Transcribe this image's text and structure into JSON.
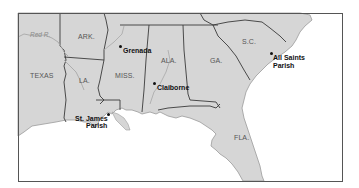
{
  "map": {
    "colors": {
      "land": "#d6d6d6",
      "water": "#ffffff",
      "border": "#3a3a3a",
      "coast": "#9a9a9a",
      "river": "#a8a8a8",
      "frame": "#555555"
    },
    "river": {
      "label": "Red R."
    },
    "states": [
      {
        "id": "texas",
        "label": "TEXAS"
      },
      {
        "id": "arkansas",
        "label": "ARK."
      },
      {
        "id": "louisiana",
        "label": "LA."
      },
      {
        "id": "mississippi",
        "label": "MISS."
      },
      {
        "id": "alabama",
        "label": "ALA."
      },
      {
        "id": "georgia",
        "label": "GA."
      },
      {
        "id": "south-carolina",
        "label": "S.C."
      },
      {
        "id": "florida",
        "label": "FLA."
      }
    ],
    "places": [
      {
        "id": "grenada",
        "line1": "Grenada",
        "line2": ""
      },
      {
        "id": "claiborne",
        "line1": "Claiborne",
        "line2": ""
      },
      {
        "id": "st-james-parish",
        "line1": "St. James",
        "line2": "Parish"
      },
      {
        "id": "all-saints-parish",
        "line1": "All Saints",
        "line2": "Parish"
      }
    ]
  }
}
